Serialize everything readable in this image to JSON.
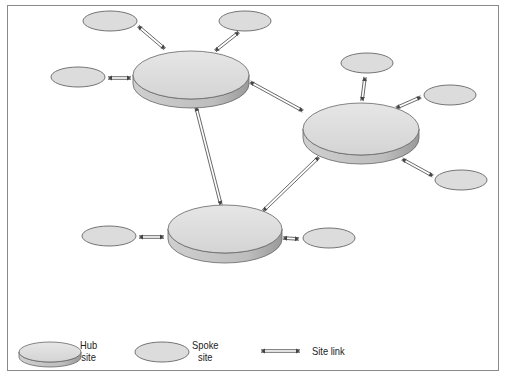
{
  "figure": {
    "title": ""
  },
  "colors": {
    "frame": "#8a8a8a",
    "shape_fill": "#dcdcdc",
    "shape_stroke": "#666666",
    "hub_side": "#b5b5b5",
    "link": "#444444"
  },
  "hubs": [
    {
      "id": "hub-top-left",
      "cx": 191,
      "cy": 75,
      "rx": 58,
      "ry": 24,
      "depth": 9
    },
    {
      "id": "hub-right",
      "cx": 361,
      "cy": 129,
      "rx": 58,
      "ry": 26,
      "depth": 9
    },
    {
      "id": "hub-bottom",
      "cx": 225,
      "cy": 229,
      "rx": 57,
      "ry": 24,
      "depth": 10
    }
  ],
  "spokes": [
    {
      "id": "spoke-1",
      "cx": 110,
      "cy": 21,
      "rx": 27,
      "ry": 10
    },
    {
      "id": "spoke-2",
      "cx": 245,
      "cy": 21,
      "rx": 26,
      "ry": 10
    },
    {
      "id": "spoke-3",
      "cx": 78,
      "cy": 77,
      "rx": 27,
      "ry": 10
    },
    {
      "id": "spoke-4",
      "cx": 367,
      "cy": 63,
      "rx": 26,
      "ry": 10
    },
    {
      "id": "spoke-5",
      "cx": 450,
      "cy": 95,
      "rx": 26,
      "ry": 10
    },
    {
      "id": "spoke-6",
      "cx": 461,
      "cy": 180,
      "rx": 26,
      "ry": 10
    },
    {
      "id": "spoke-7",
      "cx": 109,
      "cy": 236,
      "rx": 27,
      "ry": 10
    },
    {
      "id": "spoke-8",
      "cx": 329,
      "cy": 238,
      "rx": 26,
      "ry": 10
    }
  ],
  "links": [
    {
      "id": "link-s1-h1",
      "x1": 138,
      "y1": 26,
      "x2": 165,
      "y2": 49
    },
    {
      "id": "link-s2-h1",
      "x1": 239,
      "y1": 32,
      "x2": 215,
      "y2": 51
    },
    {
      "id": "link-s3-h1",
      "x1": 108,
      "y1": 78,
      "x2": 131,
      "y2": 78
    },
    {
      "id": "link-h1-h2",
      "x1": 250,
      "y1": 82,
      "x2": 303,
      "y2": 111
    },
    {
      "id": "link-h1-h3",
      "x1": 196,
      "y1": 107,
      "x2": 221,
      "y2": 205
    },
    {
      "id": "link-h2-h3",
      "x1": 319,
      "y1": 157,
      "x2": 263,
      "y2": 211
    },
    {
      "id": "link-s4-h2",
      "x1": 365,
      "y1": 77,
      "x2": 362,
      "y2": 101
    },
    {
      "id": "link-s5-h2",
      "x1": 421,
      "y1": 97,
      "x2": 396,
      "y2": 108
    },
    {
      "id": "link-s6-h2",
      "x1": 433,
      "y1": 176,
      "x2": 402,
      "y2": 159
    },
    {
      "id": "link-s7-h3",
      "x1": 139,
      "y1": 237,
      "x2": 164,
      "y2": 237
    },
    {
      "id": "link-s8-h3",
      "x1": 299,
      "y1": 239,
      "x2": 283,
      "y2": 238
    }
  ],
  "legend": {
    "hub": {
      "label_line1": "Hub",
      "label_line2": "site"
    },
    "spoke": {
      "label_line1": "Spoke",
      "label_line2": "site"
    },
    "link": {
      "label": "Site link"
    }
  }
}
